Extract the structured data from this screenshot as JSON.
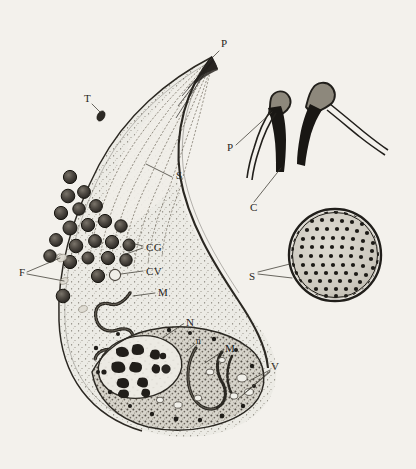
{
  "figure": {
    "background_color": "#f3f1ec",
    "ink_color": "#2b2822",
    "label_color": "#272521"
  },
  "main_cell": {
    "name": "sporozoite-longitudinal-section",
    "labels": [
      {
        "id": "apex-p",
        "text": "P",
        "x": 221,
        "y": 47,
        "anchor": "start",
        "style": "caps"
      },
      {
        "id": "toxoneme-t",
        "text": "T",
        "x": 84,
        "y": 102,
        "anchor": "start",
        "style": "caps"
      },
      {
        "id": "subpellicular-s",
        "text": "S",
        "x": 176,
        "y": 179,
        "anchor": "start",
        "style": "caps"
      },
      {
        "id": "granules-cg",
        "text": "CG",
        "x": 146,
        "y": 247,
        "anchor": "start",
        "style": "caps"
      },
      {
        "id": "vacuole-cv",
        "text": "CV",
        "x": 146,
        "y": 271,
        "anchor": "start",
        "style": "caps"
      },
      {
        "id": "fibrils-f",
        "text": "F",
        "x": 19,
        "y": 272,
        "anchor": "start",
        "style": "caps"
      },
      {
        "id": "mito-upper-m",
        "text": "M",
        "x": 158,
        "y": 292,
        "anchor": "start",
        "style": "caps"
      },
      {
        "id": "nucleus-n",
        "text": "N",
        "x": 186,
        "y": 322,
        "anchor": "start",
        "style": "caps"
      },
      {
        "id": "nucleolus-n",
        "text": "n",
        "x": 196,
        "y": 340,
        "anchor": "start",
        "style": "lower"
      },
      {
        "id": "mito-lower-m",
        "text": "M",
        "x": 225,
        "y": 348,
        "anchor": "start",
        "style": "caps"
      },
      {
        "id": "vacuoles-v",
        "text": "V",
        "x": 271,
        "y": 366,
        "anchor": "start",
        "style": "caps"
      }
    ]
  },
  "inset_hooks": {
    "name": "conoid-detail-pair",
    "labels": [
      {
        "id": "hook-paired-membrane-p",
        "text": "P",
        "x": 227,
        "y": 147,
        "anchor": "start",
        "style": "caps"
      },
      {
        "id": "hook-conoid-c",
        "text": "C",
        "x": 250,
        "y": 207,
        "anchor": "start",
        "style": "caps"
      }
    ]
  },
  "inset_cross_section": {
    "name": "transverse-section-circle",
    "center_x": 335,
    "center_y": 255,
    "radius": 48,
    "labels": [
      {
        "id": "cross-subpellicular-s",
        "text": "S",
        "x": 249,
        "y": 276,
        "anchor": "start",
        "style": "caps"
      }
    ]
  },
  "legend_keys": {
    "P": "pellicle / polar ring apex",
    "T": "toxoneme",
    "S": "subpellicular microtubules",
    "CG": "cytoplasmic granules",
    "CV": "cytoplasmic vacuole",
    "F": "fibrils",
    "M": "mitochondrion",
    "N": "nucleus",
    "n": "nucleolus",
    "V": "vacuoles",
    "C": "conoid"
  }
}
